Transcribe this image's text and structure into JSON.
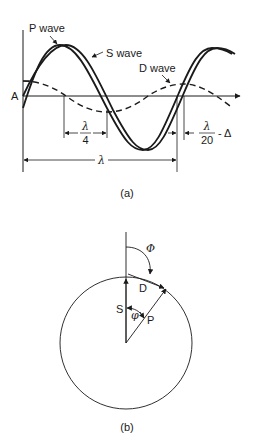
{
  "panel_a": {
    "caption": "(a)",
    "axis_label": "A",
    "labels": {
      "p_wave": "P wave",
      "s_wave": "S wave",
      "d_wave": "D wave"
    },
    "dimensions": {
      "quarter_num": "λ",
      "quarter_den": "4",
      "shift_num": "λ",
      "shift_den": "20",
      "shift_suffix": "- Δ",
      "wavelength": "λ"
    }
  },
  "panel_b": {
    "caption": "(b)",
    "labels": {
      "big_phi": "Φ",
      "d": "D",
      "s": "S",
      "small_phi": "φ",
      "p": "P"
    }
  }
}
